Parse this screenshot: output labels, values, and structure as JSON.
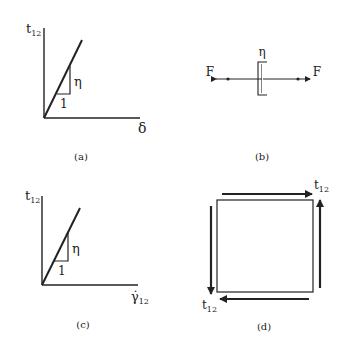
{
  "panels": {
    "a": {
      "caption": "(a)",
      "y_label": "t",
      "y_label_sub": "12",
      "x_label": "δ",
      "slope_label": "η",
      "run_label": "1"
    },
    "b": {
      "caption": "(b)",
      "element_label": "η",
      "force_left": "F",
      "force_right": "F"
    },
    "c": {
      "caption": "(c)",
      "y_label": "t",
      "y_label_sub": "12",
      "x_label": "γ̇",
      "x_label_sub": "12",
      "slope_label": "η",
      "run_label": "1"
    },
    "d": {
      "caption": "(d)",
      "top_right_label": "t",
      "top_right_sub": "12",
      "bottom_left_label": "t",
      "bottom_left_sub": "12"
    }
  },
  "colors": {
    "ink": "#222222",
    "background": "#ffffff"
  }
}
